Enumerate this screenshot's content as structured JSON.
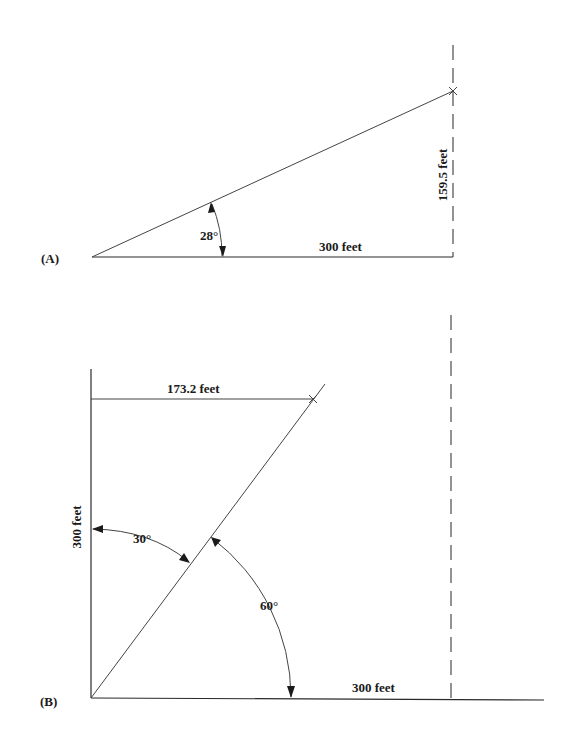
{
  "figure": {
    "panel_a": {
      "label": "(A)",
      "angle_label": "28°",
      "base_label": "300 feet",
      "height_label": "159.5 feet",
      "geometry": {
        "origin": [
          92,
          257
        ],
        "base_end": [
          453,
          257
        ],
        "hyp_end": [
          453,
          91
        ],
        "dashed_x": 453,
        "dashed_top": 45,
        "arc_start": [
          212,
          202
        ],
        "arc_end": [
          223,
          257
        ]
      }
    },
    "panel_b": {
      "label": "(B)",
      "vertical_label": "300 feet",
      "horizontal_label": "300 feet",
      "top_label": "173.2 feet",
      "angle_from_vertical_label": "30°",
      "angle_from_horizontal_label": "60°",
      "geometry": {
        "origin": [
          91,
          698
        ],
        "vertical_top": [
          91,
          369
        ],
        "base_end": [
          544,
          700
        ],
        "diagonal_end": [
          325,
          384
        ],
        "mark": [
          313,
          399
        ],
        "dashed_x": 451,
        "dashed_top": 315
      }
    },
    "colors": {
      "line": "#2a2a2a",
      "text": "#1a1a1a",
      "background": "#ffffff"
    }
  }
}
